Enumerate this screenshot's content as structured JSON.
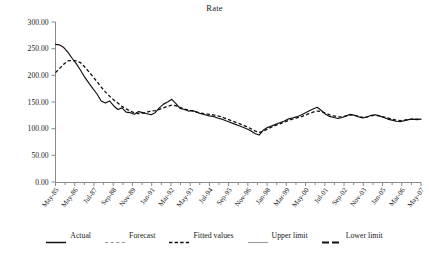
{
  "chart_data": {
    "type": "line",
    "title": "Rate",
    "xlabel": "",
    "ylabel": "",
    "ylim": [
      0,
      300
    ],
    "ytick_labels": [
      "0.00",
      "50.00",
      "100.00",
      "150.00",
      "200.00",
      "250.00",
      "300.00"
    ],
    "ytick_values": [
      0,
      50,
      100,
      150,
      200,
      250,
      300
    ],
    "grid": false,
    "legend_position": "bottom",
    "x_tick_labels": [
      "May-85",
      "May-86",
      "Jul-87",
      "Sep-88",
      "Nov-89",
      "Jan-91",
      "Mar-92",
      "May-93",
      "Jul-94",
      "Sep-95",
      "Nov-96",
      "Jan-98",
      "Mar-99",
      "May-00",
      "Jul-01",
      "Sep-02",
      "Nov-03",
      "Jan-05",
      "Mar-06",
      "May-07"
    ],
    "x_start": "May-85",
    "x_end": "May-07",
    "n_points": 89,
    "series": [
      {
        "name": "Actual",
        "style": "solid",
        "color": "#111111",
        "values": [
          258,
          257,
          252,
          243,
          232,
          222,
          210,
          197,
          186,
          175,
          165,
          152,
          148,
          152,
          143,
          136,
          139,
          131,
          130,
          127,
          132,
          130,
          128,
          126,
          130,
          139,
          146,
          150,
          155,
          147,
          138,
          136,
          133,
          134,
          131,
          128,
          126,
          124,
          123,
          120,
          118,
          115,
          112,
          109,
          106,
          103,
          100,
          96,
          91,
          88,
          97,
          102,
          105,
          108,
          111,
          114,
          118,
          120,
          122,
          125,
          129,
          133,
          137,
          140,
          134,
          127,
          123,
          121,
          119,
          121,
          124,
          127,
          125,
          122,
          120,
          122,
          125,
          126,
          124,
          121,
          118,
          116,
          114,
          113,
          115,
          117,
          118,
          117,
          118
        ]
      },
      {
        "name": "Fitted values",
        "style": "dashed",
        "color": "#111111",
        "values": [
          205,
          213,
          221,
          227,
          228,
          227,
          224,
          216,
          207,
          198,
          188,
          178,
          169,
          161,
          154,
          148,
          142,
          137,
          133,
          130,
          128,
          129,
          131,
          133,
          134,
          136,
          139,
          142,
          144,
          143,
          140,
          137,
          135,
          133,
          131,
          129,
          128,
          127,
          126,
          124,
          122,
          119,
          116,
          113,
          110,
          107,
          104,
          100,
          96,
          93,
          95,
          99,
          103,
          106,
          109,
          112,
          115,
          118,
          120,
          122,
          125,
          128,
          131,
          133,
          132,
          129,
          126,
          124,
          122,
          122,
          124,
          126,
          125,
          123,
          121,
          122,
          124,
          125,
          124,
          122,
          120,
          118,
          116,
          115,
          116,
          117,
          118,
          118,
          118
        ]
      },
      {
        "name": "Forecast",
        "style": "dashed-light",
        "color": "#9a9a9a",
        "values": []
      },
      {
        "name": "Upper limit",
        "style": "solid-light",
        "color": "#9a9a9a",
        "values": []
      },
      {
        "name": "Lower limit",
        "style": "dash-bold",
        "color": "#111111",
        "values": []
      }
    ]
  },
  "legend": {
    "items": [
      {
        "label": "Actual",
        "swatch": "solid-dark"
      },
      {
        "label": "Forecast",
        "swatch": "dashed-light"
      },
      {
        "label": "Fitted values",
        "swatch": "dashed-dark"
      },
      {
        "label": "Upper limit",
        "swatch": "solid-light"
      },
      {
        "label": "Lower limit",
        "swatch": "dash-bold"
      }
    ]
  }
}
